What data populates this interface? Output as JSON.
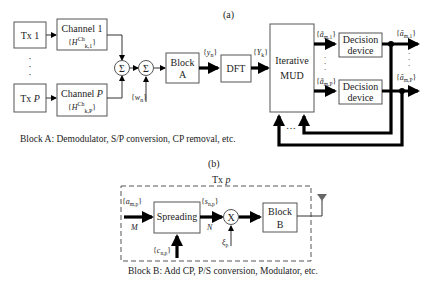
{
  "panel_a": {
    "label": "(a)",
    "tx1": "Tx 1",
    "txP": "Tx P",
    "channel1": {
      "title": "Channel 1",
      "symbol": "{H^Ch_k,1}"
    },
    "channelP": {
      "title": "Channel P",
      "symbol": "{H^Ch_k,P}"
    },
    "sum_symbol": "Σ",
    "noise": "{w_n}",
    "blockA": {
      "line1": "Block",
      "line2": "A"
    },
    "y_n": "{y_n}",
    "dft": "DFT",
    "Y_k": "{Y_k}",
    "mud": {
      "line1": "Iterative",
      "line2": "MUD"
    },
    "a_tilde_1": "{ã_m,1}",
    "a_tilde_P": "{ã_m,P}",
    "decision1": {
      "line1": "Decision",
      "line2": "device"
    },
    "decisionP": {
      "line1": "Decision",
      "line2": "device"
    },
    "a_bar_1": "{ā_m,1}",
    "a_bar_P": "{ā_m,P}",
    "feedback_dots": "…",
    "caption": "Block A: Demodulator, S/P conversion, CP removal, etc."
  },
  "panel_b": {
    "label": "(b)",
    "title": "Tx p",
    "a_in": "{a_m,p}",
    "M": "M",
    "spreading": "Spreading",
    "s_out": "{s_n,p}",
    "N": "N",
    "code": "{c_n,p}",
    "mult": "X",
    "xi": "ξ_p",
    "blockB": {
      "line1": "Block",
      "line2": "B"
    },
    "caption": "Block B: Add CP, P/S conversion, Modulator, etc."
  },
  "colors": {
    "antenna": "#666666",
    "line": "#000000",
    "box_stroke": "#555555"
  }
}
